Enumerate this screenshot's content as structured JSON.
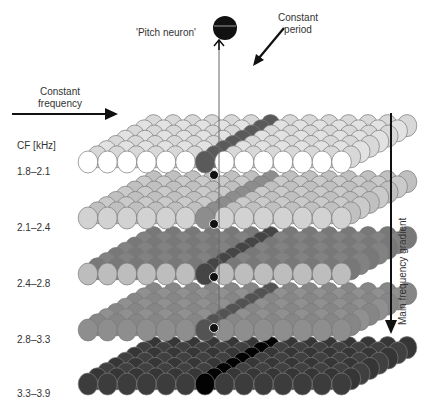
{
  "labels": {
    "pitch_neuron": "'Pitch neuron'",
    "constant_period": [
      "Constant",
      "period"
    ],
    "constant_frequency": [
      "Constant",
      "frequency"
    ],
    "cf_header": "CF [kHz]",
    "main_gradient": "Main frequency gradient"
  },
  "layers": [
    {
      "cf": "1.8–2.1",
      "fill": "#dcdcdc",
      "front": "#ffffff",
      "y": 162
    },
    {
      "cf": "2.1–2.4",
      "fill": "#c4c4c4",
      "front": "#d2d2d2",
      "y": 218
    },
    {
      "cf": "2.4–2.8",
      "fill": "#7c7c7c",
      "front": "#bdbdbd",
      "y": 274
    },
    {
      "cf": "2.8–3.3",
      "fill": "#8a8a8a",
      "front": "#8e8e8e",
      "y": 330
    },
    {
      "cf": "3.3–3.9",
      "fill": "#3a3a3a",
      "front": "#3c3c3c",
      "y": 384
    }
  ],
  "colors": {
    "period_column": "#555555",
    "pitch_neuron": "#111111",
    "arrow": "#111111",
    "stroke": "#7a7a7a"
  }
}
